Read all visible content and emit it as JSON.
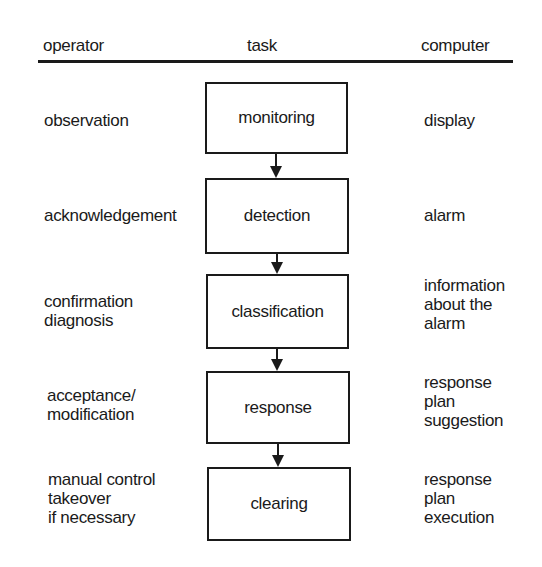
{
  "header": {
    "operator": "operator",
    "task": "task",
    "computer": "computer"
  },
  "rows": [
    {
      "operator": [
        "observation"
      ],
      "task": "monitoring",
      "computer": [
        "display"
      ]
    },
    {
      "operator": [
        "acknowledgement"
      ],
      "task": "detection",
      "computer": [
        "alarm"
      ]
    },
    {
      "operator": [
        "confirmation",
        "diagnosis"
      ],
      "task": "classification",
      "computer": [
        "information",
        "about the",
        "alarm"
      ]
    },
    {
      "operator": [
        "acceptance/",
        "modification"
      ],
      "task": "response",
      "computer": [
        "response",
        "plan",
        "suggestion"
      ]
    },
    {
      "operator": [
        "manual control",
        "takeover",
        "if necessary"
      ],
      "task": "clearing",
      "computer": [
        "response",
        "plan",
        "execution"
      ]
    }
  ],
  "colors": {
    "ink": "#1a1a1a",
    "background": "#ffffff"
  }
}
